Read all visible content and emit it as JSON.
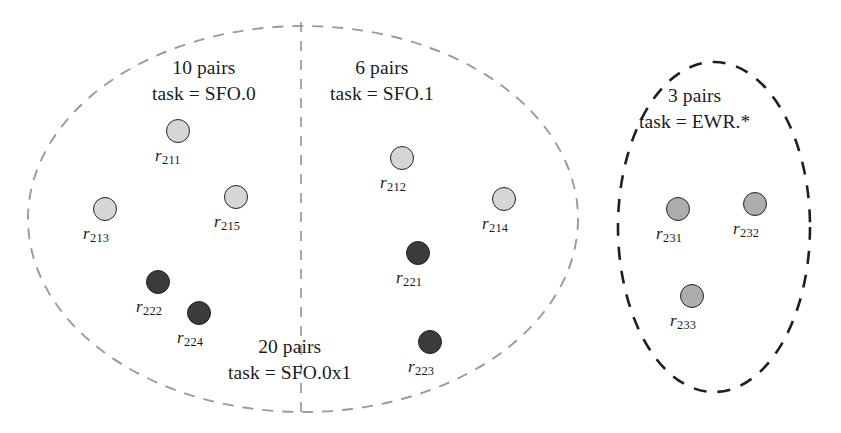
{
  "figure": {
    "background_color": "#ffffff",
    "node_outline_color": "#232323"
  },
  "groups": [
    {
      "id": "sfo-0",
      "shape": "ellipse-left-half",
      "border_style": "dashed",
      "border_color": "#9a9a9a",
      "caption_lines": [
        "10 pairs",
        "task = SFO.0"
      ],
      "caption_x": 152,
      "caption_y": 55
    },
    {
      "id": "sfo-1",
      "shape": "ellipse-right-half",
      "border_style": "dashed",
      "border_color": "#9a9a9a",
      "caption_lines": [
        "6 pairs",
        "task = SFO.1"
      ],
      "caption_x": 330,
      "caption_y": 55
    },
    {
      "id": "sfo-0x1",
      "shape": "ellipse-whole",
      "border_style": "dashed",
      "border_color": "#9a9a9a",
      "caption_lines": [
        "20 pairs",
        "task = SFO.0x1"
      ],
      "caption_x": 228,
      "caption_y": 334
    },
    {
      "id": "ewr-star",
      "shape": "ellipse",
      "border_style": "dashed",
      "border_color": "#1f1f1f",
      "caption_lines": [
        "3 pairs",
        "task = EWR.*"
      ],
      "caption_x": 639,
      "caption_y": 83
    }
  ],
  "nodes": [
    {
      "id": "r211",
      "label_prefix": "r",
      "label_sub": "211",
      "cx": 178,
      "cy": 131,
      "r": 12,
      "fill": "#d6d6d6",
      "label_x": 155,
      "label_y": 146
    },
    {
      "id": "r213",
      "label_prefix": "r",
      "label_sub": "213",
      "cx": 105,
      "cy": 209,
      "r": 12,
      "fill": "#d6d6d6",
      "label_x": 83,
      "label_y": 224
    },
    {
      "id": "r215",
      "label_prefix": "r",
      "label_sub": "215",
      "cx": 236,
      "cy": 197,
      "r": 12,
      "fill": "#d6d6d6",
      "label_x": 214,
      "label_y": 212
    },
    {
      "id": "r222",
      "label_prefix": "r",
      "label_sub": "222",
      "cx": 158,
      "cy": 282,
      "r": 12,
      "fill": "#3b3b3b",
      "label_x": 136,
      "label_y": 297
    },
    {
      "id": "r224",
      "label_prefix": "r",
      "label_sub": "224",
      "cx": 199,
      "cy": 313,
      "r": 12,
      "fill": "#3b3b3b",
      "label_x": 177,
      "label_y": 328
    },
    {
      "id": "r212",
      "label_prefix": "r",
      "label_sub": "212",
      "cx": 402,
      "cy": 158,
      "r": 12,
      "fill": "#d6d6d6",
      "label_x": 380,
      "label_y": 173
    },
    {
      "id": "r214",
      "label_prefix": "r",
      "label_sub": "214",
      "cx": 504,
      "cy": 199,
      "r": 12,
      "fill": "#d6d6d6",
      "label_x": 482,
      "label_y": 214
    },
    {
      "id": "r221",
      "label_prefix": "r",
      "label_sub": "221",
      "cx": 418,
      "cy": 253,
      "r": 12,
      "fill": "#3b3b3b",
      "label_x": 396,
      "label_y": 268
    },
    {
      "id": "r223",
      "label_prefix": "r",
      "label_sub": "223",
      "cx": 430,
      "cy": 342,
      "r": 12,
      "fill": "#3b3b3b",
      "label_x": 408,
      "label_y": 357
    },
    {
      "id": "r231",
      "label_prefix": "r",
      "label_sub": "231",
      "cx": 678,
      "cy": 209,
      "r": 12,
      "fill": "#adadad",
      "label_x": 656,
      "label_y": 224
    },
    {
      "id": "r232",
      "label_prefix": "r",
      "label_sub": "232",
      "cx": 755,
      "cy": 204,
      "r": 12,
      "fill": "#adadad",
      "label_x": 733,
      "label_y": 219
    },
    {
      "id": "r233",
      "label_prefix": "r",
      "label_sub": "233",
      "cx": 692,
      "cy": 296,
      "r": 12,
      "fill": "#adadad",
      "label_x": 670,
      "label_y": 311
    }
  ],
  "divider": {
    "id": "sfo-split-divider",
    "x": 301,
    "y1": 22,
    "y2": 414,
    "color": "#9a9a9a"
  }
}
